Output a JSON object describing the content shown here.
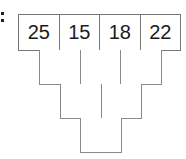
{
  "diagram": {
    "type": "number-pyramid",
    "rows": [
      {
        "cells": [
          "25",
          "15",
          "18",
          "22"
        ]
      },
      {
        "cells": [
          "",
          "",
          ""
        ]
      },
      {
        "cells": [
          "",
          ""
        ]
      },
      {
        "cells": [
          ""
        ]
      }
    ],
    "colors": {
      "border": "#8a8a8a",
      "text": "#1a1a1a",
      "background": "#ffffff"
    }
  }
}
